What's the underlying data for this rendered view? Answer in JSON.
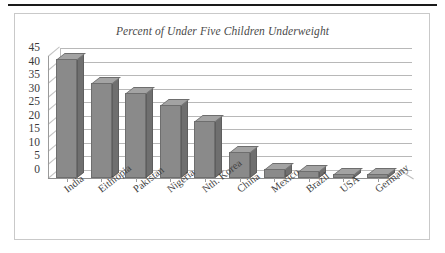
{
  "chart_data": {
    "type": "bar",
    "title": "Percent of Under Five Children Underweight",
    "xlabel": "",
    "ylabel": "",
    "ylim": [
      0,
      45
    ],
    "ytick_step": 5,
    "yticks": [
      "45",
      "40",
      "35",
      "30",
      "25",
      "20",
      "15",
      "10",
      "5",
      "0"
    ],
    "grid": true,
    "legend": "none",
    "style": "3d-column",
    "categories": [
      "India",
      "Eithiopia",
      "Pakistan",
      "Nigeria",
      "Nth. Korea",
      "China",
      "Mexico",
      "Brazil",
      "USA",
      "Germany"
    ],
    "values": [
      44,
      35,
      31.5,
      27,
      21,
      9.5,
      3.5,
      2.5,
      1.5,
      1.5
    ],
    "colors": {
      "bar_face": "#8a8a8a",
      "bar_top": "#a3a3a3",
      "bar_side": "#6f6f6f",
      "bar_outline": "#6e6e6e",
      "gridline": "#b8b8b8",
      "axis": "#8f8f8f",
      "frame": "#c9c9c9",
      "rule": "#1a1a1a",
      "text": "#3a3a3a",
      "title_text": "#4a4a4a",
      "background": "#ffffff"
    }
  }
}
